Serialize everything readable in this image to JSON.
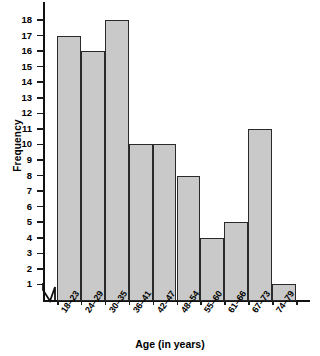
{
  "chart_data": {
    "type": "bar",
    "title": "",
    "subtitle": "",
    "xlabel": "Age (in years)",
    "ylabel": "Frequency",
    "categories": [
      "18–23",
      "24–29",
      "30–35",
      "36–41",
      "42–47",
      "48–54",
      "55–60",
      "61–66",
      "67–73",
      "74–79"
    ],
    "values": [
      17,
      16,
      18,
      10,
      10,
      8,
      4,
      5,
      11,
      1
    ],
    "ylim": [
      0,
      18
    ],
    "yticks": [
      1,
      2,
      3,
      4,
      5,
      6,
      7,
      8,
      9,
      10,
      11,
      12,
      13,
      14,
      15,
      16,
      17,
      18
    ],
    "ytick_labels": [
      "1",
      "2",
      "3",
      "4",
      "5",
      "6",
      "7",
      "8",
      "9",
      "10",
      "11",
      "12",
      "13",
      "14",
      "15",
      "16",
      "17",
      "18"
    ],
    "grid": false,
    "legend": null,
    "axis_break": "y-axis origin break",
    "bar_fill_color": "#c9c9c9",
    "bar_edge_color": "#2a2a2a",
    "axis_color": "#111111",
    "background_color": "#ffffff"
  },
  "axes": {
    "y_title": "Frequency",
    "x_title": "Age (in years)"
  }
}
